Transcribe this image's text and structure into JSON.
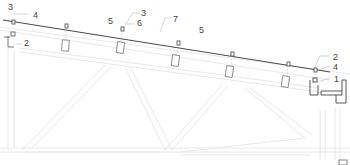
{
  "diagram": {
    "type": "structural section — sloped cable/roof line over truss",
    "colors": {
      "main_line": "#333333",
      "faint_line": "#e6e6e6",
      "leader": "#bbbbbb",
      "label": "#444444"
    },
    "callouts": [
      {
        "id": "c1",
        "text": "3",
        "x": 8,
        "y": 3
      },
      {
        "id": "c2",
        "text": "4",
        "x": 33,
        "y": 11
      },
      {
        "id": "c3",
        "text": "2",
        "x": 24,
        "y": 39
      },
      {
        "id": "c4",
        "text": "5",
        "x": 108,
        "y": 17
      },
      {
        "id": "c5",
        "text": "3",
        "x": 140,
        "y": 9
      },
      {
        "id": "c6",
        "text": "6",
        "x": 137,
        "y": 19
      },
      {
        "id": "c7",
        "text": "7",
        "x": 172,
        "y": 15
      },
      {
        "id": "c8",
        "text": "5",
        "x": 199,
        "y": 26
      },
      {
        "id": "c9",
        "text": "2",
        "x": 333,
        "y": 53
      },
      {
        "id": "c10",
        "text": "4",
        "x": 333,
        "y": 63
      },
      {
        "id": "c11",
        "text": "1",
        "x": 333,
        "y": 75
      }
    ]
  }
}
